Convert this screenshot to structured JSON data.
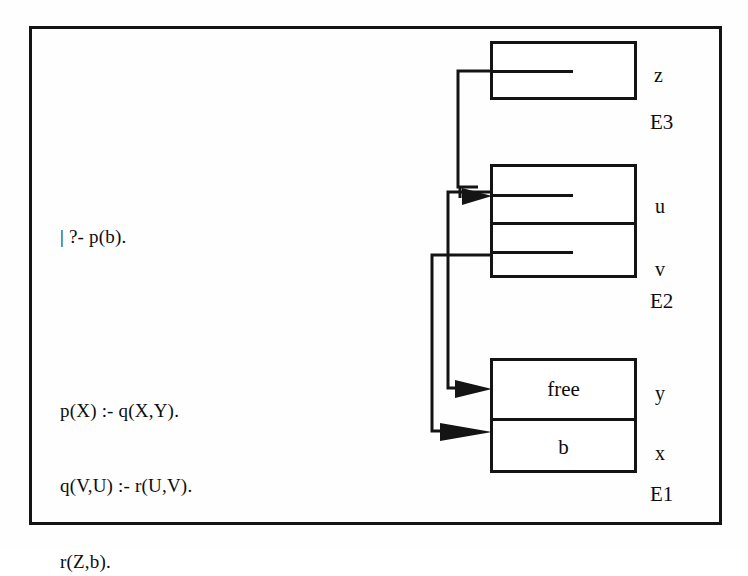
{
  "diagram": {
    "query": {
      "text": "| ?- p(b)."
    },
    "program": {
      "lines": [
        "p(X) :- q(X,Y).",
        "q(V,U) :- r(U,V).",
        "r(Z,b)."
      ]
    },
    "environments": [
      {
        "name": "E3",
        "label": "E3",
        "cells": [
          {
            "slot": "z",
            "value": "",
            "kind": "reference"
          }
        ]
      },
      {
        "name": "E2",
        "label": "E2",
        "cells": [
          {
            "slot": "u",
            "value": "",
            "kind": "reference"
          },
          {
            "slot": "v",
            "value": "",
            "kind": "reference"
          }
        ]
      },
      {
        "name": "E1",
        "label": "E1",
        "cells": [
          {
            "slot": "y",
            "value": "free",
            "kind": "value"
          },
          {
            "slot": "x",
            "value": "b",
            "kind": "value"
          }
        ]
      }
    ],
    "pointers": [
      {
        "from": "E3.z",
        "to": "E2.u"
      },
      {
        "from": "E2.u",
        "to": "E1.y"
      },
      {
        "from": "E2.v",
        "to": "E1.x"
      }
    ],
    "colors": {
      "ink": "#141414",
      "paper": "#fefefe"
    }
  }
}
